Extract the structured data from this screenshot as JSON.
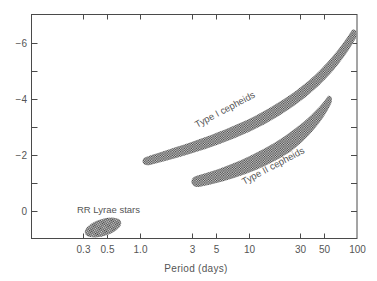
{
  "chart_data": {
    "type": "area",
    "title": "",
    "xlabel": "Period (days)",
    "ylabel": "",
    "x_scale": "log",
    "xlim": [
      0.22,
      100
    ],
    "ylim": [
      1,
      -7
    ],
    "y_inverted": true,
    "grid": false,
    "legend": "none",
    "x_ticks": [
      {
        "value": 0.3,
        "label": "0.3"
      },
      {
        "value": 0.5,
        "label": "0.5"
      },
      {
        "value": 1.0,
        "label": "1.0"
      },
      {
        "value": 3,
        "label": "3"
      },
      {
        "value": 5,
        "label": "5"
      },
      {
        "value": 10,
        "label": "10"
      },
      {
        "value": 30,
        "label": "30"
      },
      {
        "value": 50,
        "label": "50"
      },
      {
        "value": 100,
        "label": "100"
      }
    ],
    "y_ticks": [
      {
        "value": -6,
        "label": "−6"
      },
      {
        "value": -4,
        "label": "−4"
      },
      {
        "value": -2,
        "label": "−2"
      },
      {
        "value": 0,
        "label": "0"
      }
    ],
    "y_minor_ticks": [
      -5,
      -3,
      -1
    ],
    "series": [
      {
        "name": "Type I cepheids",
        "shape": "band",
        "label": "Type I cepheids",
        "period_range_days": [
          1.1,
          95
        ],
        "magnitude_at_start": -1.8,
        "magnitude_at_end": -6.3,
        "centerline": [
          {
            "period": 1.1,
            "mag": -1.8
          },
          {
            "period": 3,
            "mag": -2.5
          },
          {
            "period": 10,
            "mag": -3.7
          },
          {
            "period": 30,
            "mag": -4.9
          },
          {
            "period": 95,
            "mag": -6.3
          }
        ]
      },
      {
        "name": "Type II cepheids",
        "shape": "band",
        "label": "Type II cepheids",
        "period_range_days": [
          2.9,
          58
        ],
        "magnitude_at_start": -1.0,
        "magnitude_at_end": -4.0,
        "centerline": [
          {
            "period": 2.9,
            "mag": -1.0
          },
          {
            "period": 10,
            "mag": -1.9
          },
          {
            "period": 30,
            "mag": -3.0
          },
          {
            "period": 58,
            "mag": -4.0
          }
        ]
      },
      {
        "name": "RR Lyrae stars",
        "shape": "ellipse",
        "label": "RR Lyrae stars",
        "period_range_days": [
          0.3,
          0.65
        ],
        "magnitude_range": [
          -0.3,
          0.9
        ]
      }
    ]
  },
  "colors": {
    "axis": "#4a4a4a",
    "text": "#555555",
    "hatch_dark": "#3a3a3a",
    "hatch_light": "#d8d8d8",
    "background": "#ffffff"
  }
}
